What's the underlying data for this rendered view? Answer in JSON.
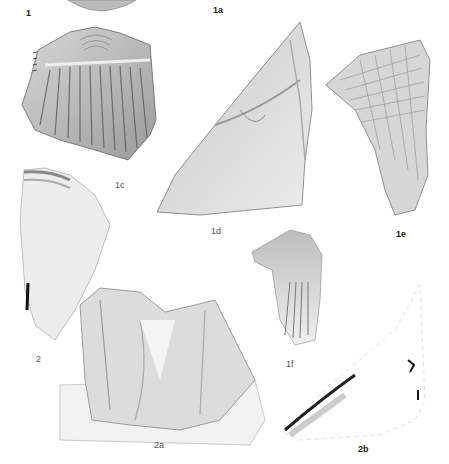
{
  "plate": {
    "background": "#ffffff",
    "figures": [
      {
        "id": "1",
        "label": "1",
        "label_pos": [
          26,
          12
        ]
      },
      {
        "id": "1a",
        "label": "1a",
        "label_pos": [
          213,
          8
        ]
      },
      {
        "id": "1c",
        "label": "1c",
        "label_pos": [
          115,
          184
        ]
      },
      {
        "id": "1d",
        "label": "1d",
        "label_pos": [
          211,
          230
        ]
      },
      {
        "id": "1e",
        "label": "1e",
        "label_pos": [
          396,
          233
        ]
      },
      {
        "id": "1f",
        "label": "1f",
        "label_pos": [
          286,
          363
        ]
      },
      {
        "id": "2",
        "label": "2",
        "label_pos": [
          36,
          358
        ]
      },
      {
        "id": "2a",
        "label": "2a",
        "label_pos": [
          154,
          444
        ]
      },
      {
        "id": "2b",
        "label": "2b",
        "label_pos": [
          358,
          448
        ]
      }
    ]
  }
}
